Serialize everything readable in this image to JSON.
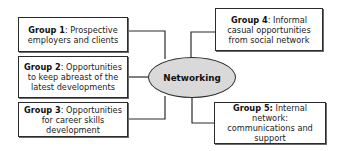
{
  "diagram": {
    "center": {
      "label": "Networking",
      "fill": "#d9d9d9"
    },
    "groups": [
      {
        "title": "Group 1",
        "sep": ": ",
        "text": "Prospective employers and clients"
      },
      {
        "title": "Group 2",
        "sep": ": ",
        "text": "Opportunities to keep abreast of the latest developments"
      },
      {
        "title": "Group 3",
        "sep": ": ",
        "text": "Opportunities for career skills development"
      },
      {
        "title": "Group 4",
        "sep": ": ",
        "text": "Informal casual opportunities from social network"
      },
      {
        "title": "Group 5:",
        "sep": " ",
        "text": "Internal network: communications and support"
      }
    ],
    "colors": {
      "border": "#2b2b2b",
      "background": "#ffffff"
    }
  }
}
